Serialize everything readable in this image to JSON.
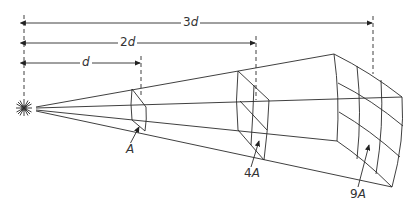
{
  "diagram": {
    "dimensions": [
      {
        "id": "d",
        "label_num": "",
        "label_var": "d",
        "x_end": 141,
        "y": 63
      },
      {
        "id": "2d",
        "label_num": "2",
        "label_var": "d",
        "x_end": 256,
        "y": 43
      },
      {
        "id": "3d",
        "label_num": "3",
        "label_var": "d",
        "x_end": 373,
        "y": 23
      }
    ],
    "areas": [
      {
        "label_num": "",
        "label_var": "A"
      },
      {
        "label_num": "4",
        "label_var": "A"
      },
      {
        "label_num": "9",
        "label_var": "A"
      }
    ],
    "source": {
      "icon": "light-source-icon"
    },
    "colors": {
      "line": "#2a2a2a",
      "background": "#ffffff"
    }
  }
}
